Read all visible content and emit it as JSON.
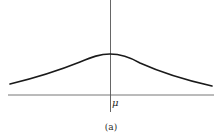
{
  "figure": {
    "caption": "(a)",
    "axis_label": "μ",
    "curve_description": "symmetric bell-shaped (flat, wide) distribution centered at μ",
    "colors": {
      "background": "#ffffff",
      "curve": "#1a1a1a",
      "axes": "#555555",
      "text": "#2a2a2a"
    }
  }
}
